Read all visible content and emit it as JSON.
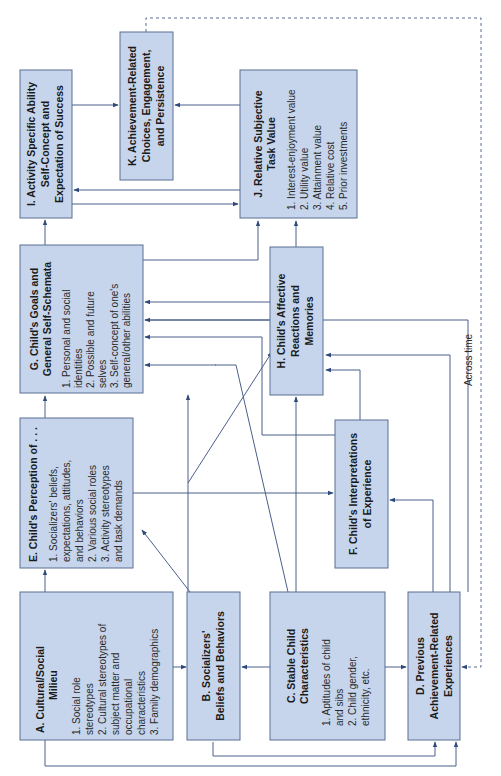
{
  "diagram": {
    "orientation": "rotated-90-ccw",
    "colors": {
      "box_fill": "#c6d5ec",
      "box_stroke": "#5a6f93",
      "line": "#4a5f8a"
    },
    "boxes": {
      "A": {
        "title1": "A. Cultural/Social",
        "title2": "Milieu",
        "items": [
          "1.  Social role",
          "     stereotypes",
          "2.  Cultural stereotypes of",
          "     subject matter and",
          "     occupational",
          "     characteristics",
          "3.  Family demographics"
        ]
      },
      "B": {
        "title1": "B. Socializers'",
        "title2": "Beliefs and Behaviors"
      },
      "C": {
        "title1": "C. Stable Child",
        "title2": "Characteristics",
        "items": [
          "1.  Aptitudes of child",
          "     and sibs",
          "2.  Child gender,",
          "     ethnicity, etc."
        ]
      },
      "D": {
        "title1": "D. Previous",
        "title2": "Achievement-Related",
        "title3": "Experiences"
      },
      "E": {
        "title1": "E. Child's Perception of . . .",
        "items": [
          "1.  Socializers' beliefs,",
          "     expectations, attitudes,",
          "     and behaviors",
          "2.  Various social roles",
          "3.  Activity stereotypes",
          "     and task demands"
        ]
      },
      "F": {
        "title1": "F. Child's Interpretations",
        "title2": "of Experience"
      },
      "G": {
        "title1": "G. Child's Goals and",
        "title2": "General Self-Schemata",
        "items": [
          "1.  Personal and social",
          "     identities",
          "2.  Possible and future",
          "     selves",
          "3.  Self-concept of one's",
          "     general/other abilities",
          "4.  Short-term goals",
          "5.  Long-term goals"
        ]
      },
      "H": {
        "title1": "H. Child's Affective",
        "title2": "Reactions and",
        "title3": "Memories"
      },
      "I": {
        "title1": "I. Activity Specific Ability",
        "title2": "Self-Concept and",
        "title3": "Expectation of Success"
      },
      "J": {
        "title1": "J. Relative Subjective",
        "title2": "Task Value",
        "items": [
          "1.  Interest-enjoyment value",
          "2.  Utility value",
          "3.  Attainment value",
          "4.  Relative cost",
          "5.  Prior investments"
        ]
      },
      "K": {
        "title1": "K. Achievement-Related",
        "title2": "Choices, Engagement,",
        "title3": "and Persistence"
      }
    },
    "annotations": {
      "across_time": "Across time"
    }
  }
}
